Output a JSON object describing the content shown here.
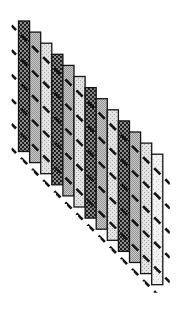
{
  "figure": {
    "kind": "skewed-bar-staircase-diagram",
    "background": "#ffffff",
    "outline_color": "#141414",
    "dash_color": "#161616",
    "bars": {
      "count": 13,
      "x0": 18.5,
      "y0": 21,
      "pitch_x": 11.1,
      "pitch_y": 11.1,
      "width": 11.1,
      "height": 130.5,
      "shades": [
        "dark",
        "medium",
        "light",
        "dark",
        "medium",
        "light",
        "dark",
        "medium",
        "light",
        "dark",
        "medium",
        "light",
        "lightest"
      ]
    },
    "diagonals": {
      "count": 6,
      "slope": 1,
      "intercept0": 14,
      "spacing": 24.6,
      "start_x": 11.5,
      "end_x": 170,
      "dash_on": 8.8,
      "dash_off": 6.9,
      "dash_offset": 2.35,
      "stroke_width": 2.6,
      "clip_pad_x": 7,
      "clip_pad_top": 5,
      "clip_pad_bottom": 8
    },
    "palette": {
      "dark_bg": "#8d8d8d",
      "dark_fg": "#1f1f1f",
      "medium_bg": "#c9c9c9",
      "medium_fg": "#949494",
      "light_bg": "#e2e2e2",
      "light_fg": "#a8a8a8",
      "lightest_bg": "#f2f2f2",
      "lightest_fg": "#c4c4c4"
    }
  }
}
